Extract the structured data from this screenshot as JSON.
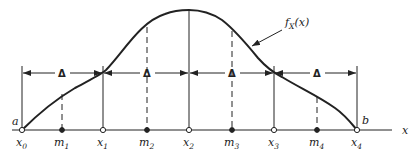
{
  "diagram": {
    "type": "probability-density-partition",
    "curve_label": "f_X(x)",
    "curve_label_main": "f",
    "curve_label_sub": "X",
    "curve_label_arg": "(x)",
    "axis_label": "x",
    "left_bound_label": "a",
    "right_bound_label": "b",
    "interval_label": "Δ",
    "interval_count": 4,
    "partition_points": [
      {
        "name": "x0",
        "base": "x",
        "sub": "0",
        "x": 22
      },
      {
        "name": "x1",
        "base": "x",
        "sub": "1",
        "x": 103
      },
      {
        "name": "x2",
        "base": "x",
        "sub": "2",
        "x": 189
      },
      {
        "name": "x3",
        "base": "x",
        "sub": "3",
        "x": 274
      },
      {
        "name": "x4",
        "base": "x",
        "sub": "4",
        "x": 357
      }
    ],
    "midpoints": [
      {
        "name": "m1",
        "base": "m",
        "sub": "1",
        "x": 62
      },
      {
        "name": "m2",
        "base": "m",
        "sub": "2",
        "x": 147
      },
      {
        "name": "m3",
        "base": "m",
        "sub": "3",
        "x": 232
      },
      {
        "name": "m4",
        "base": "m",
        "sub": "4",
        "x": 317
      }
    ],
    "colors": {
      "ink": "#222222",
      "background": "#ffffff"
    }
  }
}
